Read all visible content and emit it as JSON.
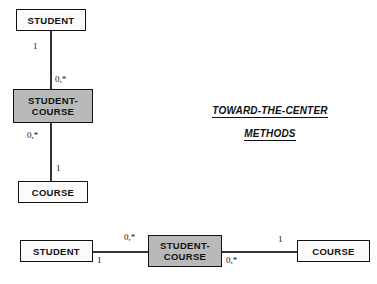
{
  "caption": {
    "line1": "TOWARD-THE-CENTER",
    "line2": "METHODS"
  },
  "vertical_diagram": {
    "nodes": {
      "student": {
        "label": "STUDENT",
        "fill": "#fbfbfb"
      },
      "student_course": {
        "label": "STUDENT-\nCOURSE",
        "fill": "#b9b9b9"
      },
      "course": {
        "label": "COURSE",
        "fill": "#fbfbfb"
      }
    },
    "edges": [
      {
        "from": "student",
        "to": "student_course",
        "from_cardinality": "1",
        "to_cardinality": "0,*"
      },
      {
        "from": "student_course",
        "to": "course",
        "from_cardinality": "0,*",
        "to_cardinality": "1"
      }
    ]
  },
  "horizontal_diagram": {
    "nodes": {
      "student": {
        "label": "STUDENT",
        "fill": "#fbfbfb"
      },
      "student_course": {
        "label": "STUDENT-\nCOURSE",
        "fill": "#b9b9b9"
      },
      "course": {
        "label": "COURSE",
        "fill": "#fbfbfb"
      }
    },
    "edges": [
      {
        "from": "student",
        "to": "student_course",
        "from_cardinality": "1",
        "to_cardinality": "0,*"
      },
      {
        "from": "student_course",
        "to": "course",
        "from_cardinality": "0,*",
        "to_cardinality": "1"
      }
    ]
  }
}
